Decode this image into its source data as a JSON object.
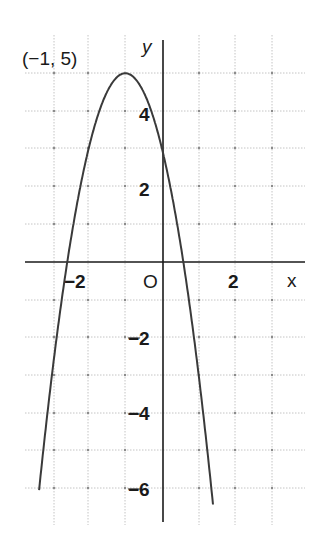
{
  "chart_data": {
    "type": "line",
    "title": "",
    "function": "y = -2(x+1)^2 + 5",
    "xlabel": "x",
    "ylabel": "y",
    "origin_label": "O",
    "xlim": [
      -3.3,
      3.7
    ],
    "ylim": [
      -6.7,
      5.4
    ],
    "grid": true,
    "x_ticks": [
      {
        "value": -2,
        "label": "-2"
      },
      {
        "value": 2,
        "label": "2"
      }
    ],
    "y_ticks": [
      {
        "value": 4,
        "label": "4"
      },
      {
        "value": 2,
        "label": "2"
      },
      {
        "value": -2,
        "label": "-2"
      },
      {
        "value": -4,
        "label": "-4"
      },
      {
        "value": -6,
        "label": "-6"
      }
    ],
    "annotations": [
      {
        "text": "(-1, 5)",
        "x": -1,
        "y": 5,
        "note": "vertex"
      }
    ],
    "series": [
      {
        "name": "parabola",
        "x": [
          -3.35,
          -3,
          -2.5,
          -2,
          -1.5,
          -1,
          -0.5,
          0,
          0.5,
          1,
          1.5,
          1.6
        ],
        "values": [
          -6.05,
          -3,
          0.5,
          3,
          4.5,
          5,
          4.5,
          3,
          0.5,
          -3,
          -7.5,
          -8.5
        ]
      }
    ],
    "color": "#3a3a3a"
  },
  "labels": {
    "vertex": "(−1, 5)",
    "x_axis": "x",
    "y_axis": "y",
    "origin": "O",
    "tick_x_neg2": "−2",
    "tick_x_2": "2",
    "tick_y_4": "4",
    "tick_y_2": "2",
    "tick_y_neg2": "−2",
    "tick_y_neg4": "−4",
    "tick_y_neg6": "−6"
  }
}
